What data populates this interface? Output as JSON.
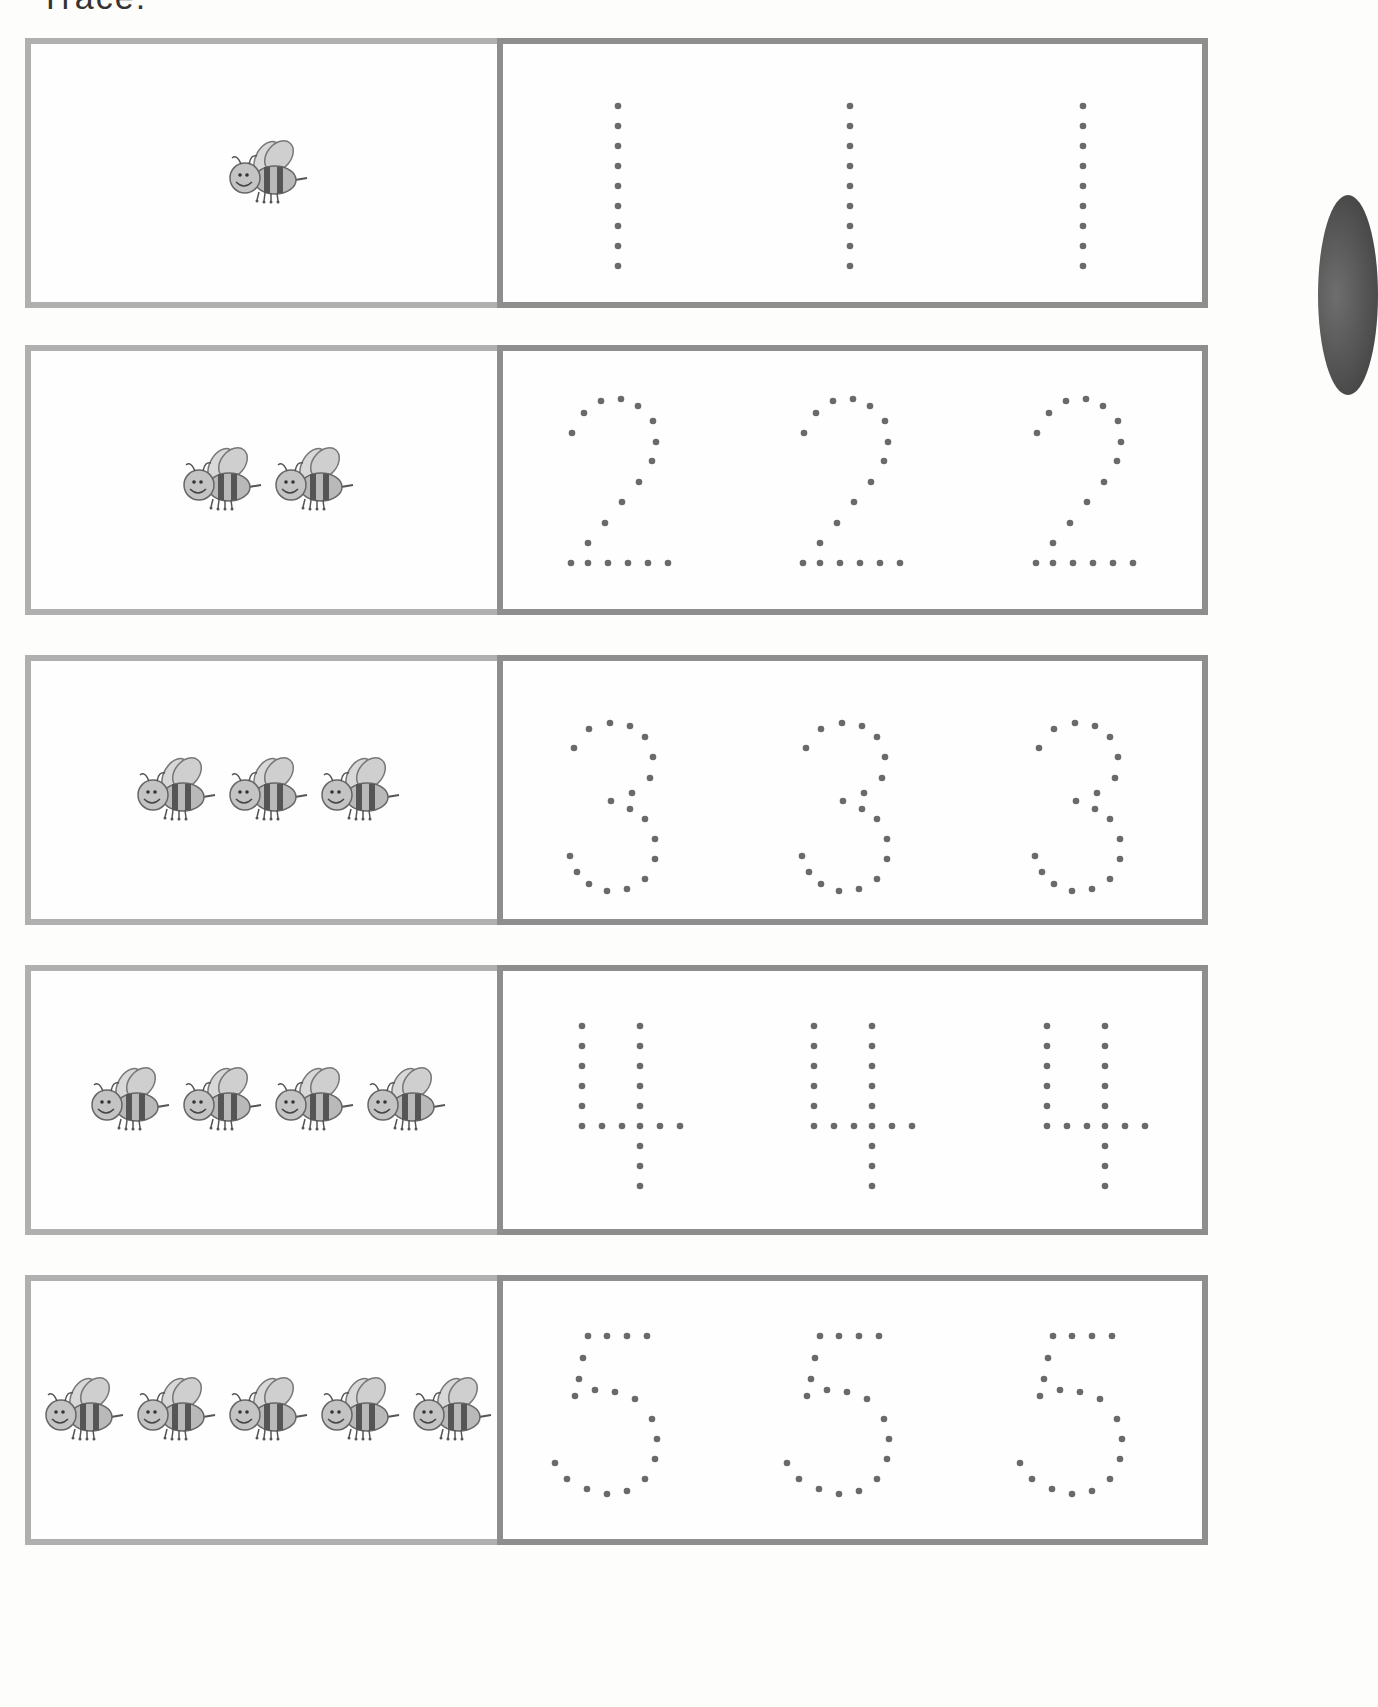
{
  "page": {
    "header_fragment": "Trace.",
    "colors": {
      "pic_border": "#b0b0b0",
      "trace_border": "#8e8e8e",
      "dot": "#6a6a6a",
      "background": "#fdfdfc"
    }
  },
  "rows": [
    {
      "count": 1,
      "digit": "1",
      "bee_count_label": "1 bee",
      "trace_cells": [
        "1",
        "1",
        "1"
      ]
    },
    {
      "count": 2,
      "digit": "2",
      "bee_count_label": "2 bees",
      "trace_cells": [
        "2",
        "2",
        "2"
      ]
    },
    {
      "count": 3,
      "digit": "3",
      "bee_count_label": "3 bees",
      "trace_cells": [
        "3",
        "3",
        "3"
      ]
    },
    {
      "count": 4,
      "digit": "4",
      "bee_count_label": "4 bees",
      "trace_cells": [
        "4",
        "4",
        "4"
      ]
    },
    {
      "count": 5,
      "digit": "5",
      "bee_count_label": "5 bees",
      "trace_cells": [
        "5",
        "5",
        "5"
      ]
    }
  ],
  "icons": {
    "bee": "bee-icon",
    "side_tab": "page-tab"
  }
}
